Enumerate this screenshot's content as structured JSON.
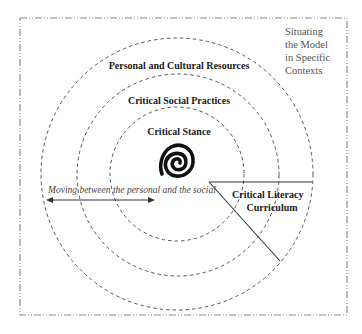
{
  "diagram": {
    "frame_label": [
      "Situating",
      "the Model",
      "in Specific",
      "Contexts"
    ],
    "rings": [
      {
        "label": "Personal and Cultural Resources",
        "radius": 136
      },
      {
        "label": "Critical Social Practices",
        "radius": 101
      },
      {
        "label": "Critical Stance",
        "radius": 67
      }
    ],
    "center_symbol": "spiral-icon",
    "arrow_label": "Moving between the personal and the social",
    "wedge_label": [
      "Critical Literacy",
      "Curriculum"
    ],
    "colors": {
      "frame": "#8a8a8a",
      "rings": "#555555",
      "lines": "#333333",
      "spiral": "#111111",
      "background": "#ffffff"
    }
  }
}
